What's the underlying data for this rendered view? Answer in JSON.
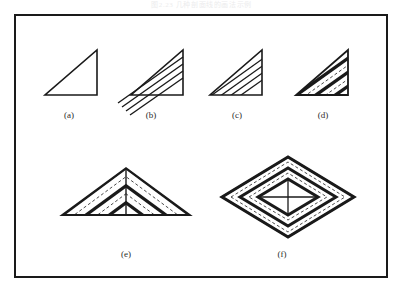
{
  "page": {
    "background_color": "#ffffff",
    "header_faint_text": "图2.23  几种剖面线的画法示例",
    "frame": {
      "stroke_color": "#1a1a1a",
      "stroke_width": 2,
      "x": 14,
      "y": 14,
      "width": 374,
      "height": 264
    }
  },
  "figures": [
    {
      "id": "a",
      "caption": "(a)",
      "description": "plain right triangle outline, no hatching",
      "hatch_style": "none",
      "shape": "right-triangle",
      "caption_x": 49,
      "caption_y": 110
    },
    {
      "id": "b",
      "caption": "(b)",
      "description": "right triangle with thin diagonal hatch lines overflowing past the boundary",
      "hatch_style": "overflowing-thin",
      "shape": "right-triangle",
      "caption_x": 131,
      "caption_y": 110
    },
    {
      "id": "c",
      "caption": "(c)",
      "description": "right triangle with thin diagonal hatch lines clipped to the outline",
      "hatch_style": "clipped-thin",
      "shape": "right-triangle",
      "caption_x": 217,
      "caption_y": 110
    },
    {
      "id": "d",
      "caption": "(d)",
      "description": "right triangle with thick diagonal bands separated by thin gaps",
      "hatch_style": "thick-bands",
      "shape": "right-triangle",
      "caption_x": 303,
      "caption_y": 110
    },
    {
      "id": "e",
      "caption": "(e)",
      "description": "symmetric peak of two mirrored triangles with a vertical centre line and chevron hatching",
      "hatch_style": "thick-bands-mirrored",
      "shape": "peak-gable",
      "caption_x": 106,
      "caption_y": 249
    },
    {
      "id": "f",
      "caption": "(f)",
      "description": "rhombus with nested concentric diamond bands and a central cross",
      "hatch_style": "concentric-diamonds",
      "shape": "rhombus",
      "caption_x": 262,
      "caption_y": 249
    }
  ],
  "colors": {
    "ink": "#1a1a1a",
    "caption_ink": "#2b2b2b",
    "paper": "#ffffff",
    "faint_header": "#ececed"
  }
}
